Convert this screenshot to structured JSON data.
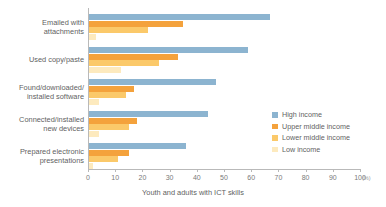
{
  "chart_data": {
    "type": "bar",
    "orientation": "horizontal",
    "title": "",
    "xlabel": "Youth and adults with ICT skills",
    "ylabel": "",
    "unit": "(%)",
    "xlim": [
      0,
      100
    ],
    "xticks": [
      0,
      10,
      20,
      30,
      40,
      50,
      60,
      70,
      80,
      90,
      100
    ],
    "xtick_labels": [
      "0",
      "10",
      "20",
      "30",
      "40",
      "50",
      "60",
      "70",
      "80",
      "90",
      "100"
    ],
    "grid": false,
    "legend_position": "right",
    "categories": [
      "Emailed with attachments",
      "Used copy/paste",
      "Found/downloaded/ installed software",
      "Connected/installed new devices",
      "Prepared electronic presentations"
    ],
    "category_lines": [
      [
        "Emailed with",
        "attachments"
      ],
      [
        "Used copy/paste"
      ],
      [
        "Found/downloaded/",
        "installed software"
      ],
      [
        "Connected/installed",
        "new devices"
      ],
      [
        "Prepared electronic",
        "presentations"
      ]
    ],
    "series": [
      {
        "name": "High income",
        "color": "#8cb4d0",
        "values": [
          67,
          59,
          47,
          44,
          36
        ]
      },
      {
        "name": "Upper middle income",
        "color": "#f4a23c",
        "values": [
          35,
          33,
          17,
          18,
          15
        ]
      },
      {
        "name": "Lower middle income",
        "color": "#fbc96a",
        "values": [
          22,
          26,
          14,
          15,
          11
        ]
      },
      {
        "name": "Low income",
        "color": "#fdeabe",
        "values": [
          3,
          12,
          4,
          4,
          2
        ]
      }
    ]
  },
  "legend": {
    "items": [
      {
        "label": "High income",
        "color": "#8cb4d0"
      },
      {
        "label": "Upper middle income",
        "color": "#f4a23c"
      },
      {
        "label": "Lower middle income",
        "color": "#fbc96a"
      },
      {
        "label": "Low income",
        "color": "#fdeabe"
      }
    ]
  },
  "axis": {
    "x_title": "Youth and adults with ICT skills",
    "percent_symbol": "(%)"
  }
}
